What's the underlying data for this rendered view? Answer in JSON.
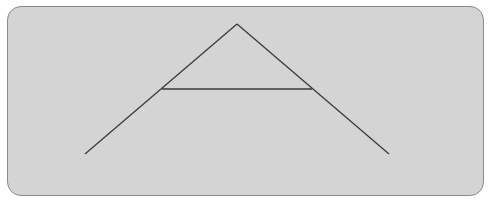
{
  "figure": {
    "caption_clipped": "",
    "panel": {
      "background": "#d4d4d4",
      "border": "#8a8a8a",
      "corner_radius": 14
    },
    "shape": "A-frame (letter A shape)",
    "line_color": "#3a3a3a",
    "segments": [
      {
        "name": "left-leg",
        "x1": 85,
        "y1": 154,
        "x2": 237,
        "y2": 24
      },
      {
        "name": "right-leg",
        "x1": 237,
        "y1": 24,
        "x2": 389,
        "y2": 154
      },
      {
        "name": "crossbar",
        "x1": 162,
        "y1": 89,
        "x2": 312,
        "y2": 89
      }
    ],
    "points": {
      "apex": [
        237,
        24
      ],
      "left_foot": [
        85,
        154
      ],
      "right_foot": [
        389,
        154
      ],
      "crossbar_left": [
        162,
        89
      ],
      "crossbar_right": [
        312,
        89
      ]
    }
  }
}
